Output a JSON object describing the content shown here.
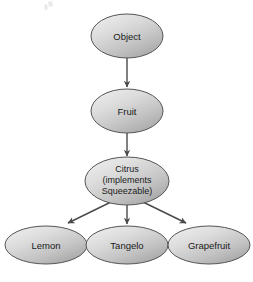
{
  "diagram": {
    "type": "class-hierarchy",
    "title": "",
    "background_color": "#ffffff",
    "node_fill_light": "#e6e6e6",
    "node_fill_mid": "#c9c9c9",
    "node_fill_dark": "#9a9a9a",
    "node_stroke_color": "#555555",
    "edge_color": "#4a4a4a",
    "text_color": "#1a1a1a",
    "nodes": [
      {
        "id": "object",
        "label": "Object",
        "lines": [
          "Object"
        ],
        "cx": 127,
        "cy": 36,
        "rx": 36,
        "ry": 22
      },
      {
        "id": "fruit",
        "label": "Fruit",
        "lines": [
          "Fruit"
        ],
        "cx": 127,
        "cy": 111,
        "rx": 36,
        "ry": 22
      },
      {
        "id": "citrus",
        "label": "Citrus (implements Squeezable)",
        "lines": [
          "Citrus",
          "(implements",
          "Squeezable)"
        ],
        "cx": 127,
        "cy": 181,
        "rx": 42,
        "ry": 24
      },
      {
        "id": "lemon",
        "label": "Lemon",
        "lines": [
          "Lemon"
        ],
        "cx": 46,
        "cy": 245,
        "rx": 41,
        "ry": 19
      },
      {
        "id": "tangelo",
        "label": "Tangelo",
        "lines": [
          "Tangelo"
        ],
        "cx": 127,
        "cy": 245,
        "rx": 41,
        "ry": 19
      },
      {
        "id": "grapefruit",
        "label": "Grapefruit",
        "lines": [
          "Grapefruit"
        ],
        "cx": 209,
        "cy": 245,
        "rx": 41,
        "ry": 19
      }
    ],
    "edges": [
      {
        "id": "object-fruit",
        "from": "object",
        "to": "fruit",
        "x1": 127,
        "y1": 58,
        "x2": 127,
        "y2": 87
      },
      {
        "id": "fruit-citrus",
        "from": "fruit",
        "to": "citrus",
        "x1": 127,
        "y1": 133,
        "x2": 127,
        "y2": 155
      },
      {
        "id": "citrus-lemon",
        "from": "citrus",
        "to": "lemon",
        "x1": 111,
        "y1": 202,
        "x2": 66,
        "y2": 224
      },
      {
        "id": "citrus-tangelo",
        "from": "citrus",
        "to": "tangelo",
        "x1": 127,
        "y1": 205,
        "x2": 127,
        "y2": 224
      },
      {
        "id": "citrus-grapefruit",
        "from": "citrus",
        "to": "grapefruit",
        "x1": 143,
        "y1": 202,
        "x2": 188,
        "y2": 224
      }
    ]
  }
}
